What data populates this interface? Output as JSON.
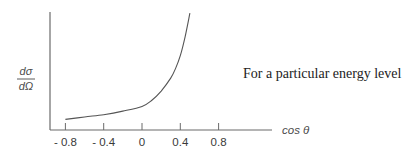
{
  "chart_data": {
    "type": "line",
    "title": "",
    "xlabel": "cos θ",
    "ylabel": "dσ/dΩ",
    "ylabel_parts": {
      "numerator": "dσ",
      "denominator": "dΩ"
    },
    "annotation": "For a particular energy level",
    "x_ticks": [
      -0.8,
      -0.4,
      0,
      0.4,
      0.8
    ],
    "x_tick_labels": [
      "- 0.8",
      "- 0.4",
      "0",
      "0.4",
      "0.8"
    ],
    "xlim": [
      -0.95,
      1.4
    ],
    "ylim": [
      0,
      1
    ],
    "y_scale": "relative (no numeric ticks shown)",
    "grid": false,
    "legend": null,
    "series": [
      {
        "name": "dσ/dΩ",
        "x": [
          -0.8,
          -0.6,
          -0.4,
          -0.2,
          0.0,
          0.1,
          0.2,
          0.3,
          0.35,
          0.4,
          0.45,
          0.5
        ],
        "y": [
          0.09,
          0.11,
          0.13,
          0.16,
          0.2,
          0.25,
          0.33,
          0.44,
          0.52,
          0.63,
          0.79,
          0.99
        ]
      }
    ]
  }
}
